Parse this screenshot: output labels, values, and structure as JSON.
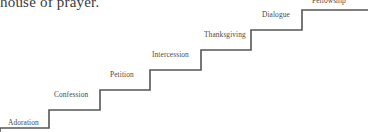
{
  "figure": {
    "type": "staircase-diagram",
    "title_fragment": "house of prayer.",
    "stroke_color": "#555555",
    "text_color": "#4a4a4a",
    "background_color": "#ffffff",
    "steps": [
      {
        "label": "Adoration",
        "order": 1,
        "label_x": 8,
        "label_y": 118,
        "tread_y": 128,
        "riser_x": 49
      },
      {
        "label": "Confession",
        "order": 2,
        "label_x": 54,
        "label_y": 90,
        "tread_y": 110,
        "riser_x": 100
      },
      {
        "label": "Petition",
        "order": 3,
        "label_x": 110,
        "label_y": 73,
        "tread_y": 90,
        "riser_x": 150
      },
      {
        "label": "Intercession",
        "order": 4,
        "label_x": 152,
        "label_y": 53,
        "tread_y": 70,
        "riser_x": 201
      },
      {
        "label": "Thanksgiving",
        "order": 5,
        "label_x": 204,
        "label_y": 33,
        "tread_y": 50,
        "riser_x": 251
      },
      {
        "label": "Dialogue",
        "order": 6,
        "label_x": 262,
        "label_y": 13,
        "tread_y": 30,
        "riser_x": 302
      },
      {
        "label": "Fellowship",
        "order": 7,
        "label_x": 312,
        "label_y": -4,
        "tread_y": 10,
        "riser_x": 368
      }
    ],
    "path_points": "0,132 0,128 49,128 49,110 100,110 100,90 150,90 150,70 201,70 201,50 251,50 251,30 302,30 302,10 368,10"
  }
}
